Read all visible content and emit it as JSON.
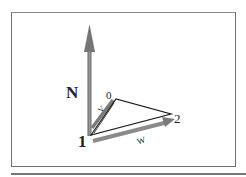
{
  "diagram": {
    "labels": {
      "normal": "N",
      "vertex0": "0",
      "vertex1": "1",
      "vertex2": "2",
      "edge_v": "V",
      "edge_w": "W"
    },
    "colors": {
      "arrow": "#7a7a7a",
      "triangle": "#1a1a1a",
      "frame": "#6e6e6e"
    }
  }
}
